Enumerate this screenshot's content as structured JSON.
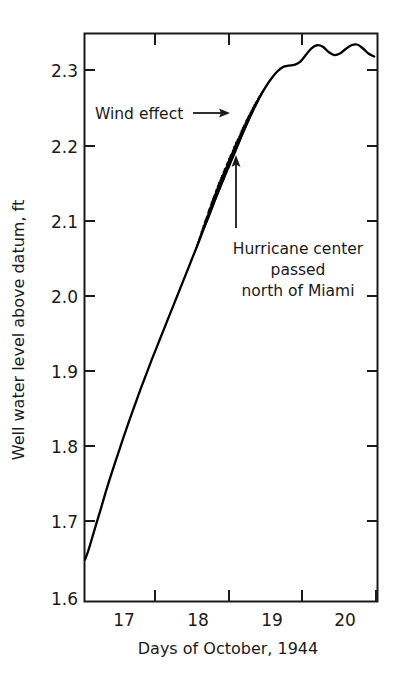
{
  "chart_data": {
    "type": "line",
    "title": "",
    "xlabel": "Days of October, 1944",
    "ylabel": "Well water level above datum, ft",
    "xlim": [
      16.4,
      20.5
    ],
    "ylim": [
      1.6,
      2.355
    ],
    "xticks": [
      17,
      18,
      19,
      20
    ],
    "xtick_labels": [
      "17",
      "18",
      "19",
      "20"
    ],
    "yticks": [
      1.6,
      1.7,
      1.8,
      1.9,
      2.0,
      2.1,
      2.2,
      2.3
    ],
    "ytick_labels": [
      "1.6",
      "1.7",
      "1.8",
      "1.9",
      "2.0",
      "2.1",
      "2.2",
      "2.3"
    ],
    "grid": false,
    "legend": null,
    "series": [
      {
        "name": "Well water level",
        "x": [
          16.4,
          16.45,
          16.5,
          16.55,
          16.62,
          16.7,
          16.78,
          16.86,
          16.94,
          17.02,
          17.1,
          17.18,
          17.26,
          17.34,
          17.42,
          17.5,
          17.58,
          17.66,
          17.74,
          17.82,
          17.9,
          17.98,
          18.06,
          18.14,
          18.22,
          18.3,
          18.38,
          18.46,
          18.54,
          18.62,
          18.7,
          18.78,
          18.86,
          18.94,
          19.02,
          19.1,
          19.18,
          19.26,
          19.34,
          19.42,
          19.5,
          19.58,
          19.66,
          19.74,
          19.82,
          19.9,
          19.98,
          20.06,
          20.14,
          20.22,
          20.3,
          20.38,
          20.46
        ],
        "y": [
          1.655,
          1.668,
          1.684,
          1.7,
          1.722,
          1.748,
          1.772,
          1.795,
          1.818,
          1.84,
          1.861,
          1.882,
          1.902,
          1.922,
          1.941,
          1.96,
          1.979,
          1.998,
          2.017,
          2.036,
          2.055,
          2.074,
          2.094,
          2.113,
          2.133,
          2.152,
          2.17,
          2.188,
          2.206,
          2.224,
          2.241,
          2.257,
          2.272,
          2.285,
          2.296,
          2.305,
          2.311,
          2.313,
          2.314,
          2.318,
          2.327,
          2.336,
          2.34,
          2.338,
          2.331,
          2.327,
          2.329,
          2.335,
          2.34,
          2.341,
          2.336,
          2.329,
          2.325
        ]
      }
    ],
    "noise_band": {
      "description": "high-frequency wind-driven oscillation superimposed on the rising limb",
      "x_start": 17.95,
      "x_end": 18.98,
      "peak_amplitude_ft": 0.012
    },
    "annotations": [
      {
        "name": "wind-effect",
        "text": "Wind effect",
        "arrow": "right",
        "x_text": 17.0,
        "y_text": 2.245,
        "x_tip": 18.02,
        "y_tip": 2.243
      },
      {
        "name": "hurricane-center",
        "lines": [
          "Hurricane center",
          "passed",
          "north of Miami"
        ],
        "arrow": "up",
        "x_tip": 18.47,
        "y_tip": 2.205,
        "y_tail": 2.108
      }
    ]
  },
  "axes": {
    "xlabel": "Days of October, 1944",
    "ylabel": "Well water level above datum, ft"
  },
  "annotations": {
    "wind_effect": "Wind effect",
    "hurricane_line1": "Hurricane center",
    "hurricane_line2": "passed",
    "hurricane_line3": "north of Miami"
  },
  "colors": {
    "ink": "#1a1a1a",
    "background": "#ffffff",
    "curve": "#000000"
  }
}
